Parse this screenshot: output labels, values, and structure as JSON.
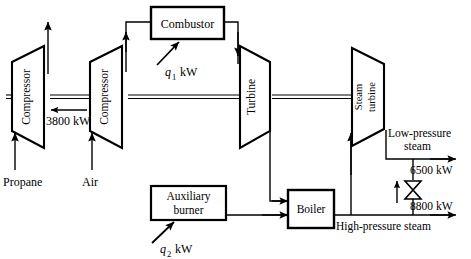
{
  "diagram": {
    "colors": {
      "line": "#000000",
      "fill": "#ffffff",
      "background": "#ffffff"
    },
    "units": "kW",
    "components": [
      {
        "id": "compressor_1",
        "label": "Compressor",
        "type": "trapezoid-compressor"
      },
      {
        "id": "compressor_2",
        "label": "Compressor",
        "type": "trapezoid-compressor"
      },
      {
        "id": "combustor",
        "label": "Combustor",
        "type": "box"
      },
      {
        "id": "turbine",
        "label": "Turbine",
        "type": "trapezoid-turbine"
      },
      {
        "id": "steam_turbine",
        "label_line1": "Steam",
        "label_line2": "turbine",
        "type": "trapezoid-turbine"
      },
      {
        "id": "auxiliary_burner",
        "label_line1": "Auxiliary",
        "label_line2": "burner",
        "type": "box"
      },
      {
        "id": "boiler",
        "label": "Boiler",
        "type": "box"
      },
      {
        "id": "valve",
        "label": "",
        "type": "bowtie-valve"
      }
    ],
    "streams": [
      {
        "id": "propane_inlet",
        "label": "Propane",
        "direction": "up"
      },
      {
        "id": "air_inlet",
        "label": "Air",
        "direction": "up"
      },
      {
        "id": "low_pressure_steam",
        "label_line1": "Low-pressure",
        "label_line2": "steam",
        "direction": "right"
      },
      {
        "id": "high_pressure_steam",
        "label": "High-pressure steam",
        "direction": "right"
      }
    ],
    "energy_labels": [
      {
        "id": "shaft_work",
        "value": "3800",
        "unit": "kW",
        "text": "3800 kW",
        "direction": "left"
      },
      {
        "id": "combustor_heat",
        "symbol": "q",
        "subscript": "1",
        "unit": "kW",
        "text": "kW"
      },
      {
        "id": "burner_heat",
        "symbol": "q",
        "subscript": "2",
        "unit": "kW",
        "text": "kW"
      },
      {
        "id": "lp_steam_energy",
        "value": "6500",
        "unit": "kW",
        "text": "6500 kW",
        "direction": "right"
      },
      {
        "id": "hp_steam_energy",
        "value": "8800",
        "unit": "kW",
        "text": "8800 kW",
        "direction": "right"
      }
    ]
  }
}
